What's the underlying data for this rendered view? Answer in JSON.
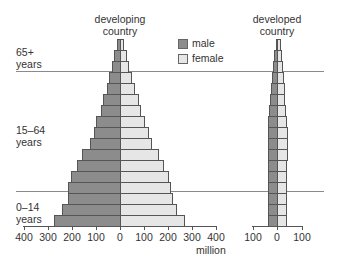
{
  "chart_data": {
    "type": "bar",
    "subtype": "population-pyramid",
    "unit": "million",
    "legend": [
      {
        "name": "male",
        "color": "#8c8c8c"
      },
      {
        "name": "female",
        "color": "#e6e6e6"
      }
    ],
    "age_groups": [
      "0–14 years",
      "15–64 years",
      "65+ years"
    ],
    "charts": [
      {
        "title": "developing country",
        "xlim": [
          -400,
          400
        ],
        "xticks": [
          "400",
          "300",
          "200",
          "100",
          "0",
          "100",
          "200",
          "300",
          "400"
        ],
        "xlabel": "million",
        "bars_bottom_to_top": {
          "male": [
            275,
            240,
            215,
            215,
            205,
            180,
            160,
            125,
            110,
            100,
            80,
            70,
            55,
            45,
            35,
            25,
            12
          ],
          "female": [
            265,
            235,
            215,
            210,
            200,
            180,
            160,
            130,
            115,
            100,
            85,
            75,
            60,
            45,
            35,
            25,
            12
          ]
        }
      },
      {
        "title": "developed country",
        "xlim": [
          -100,
          100
        ],
        "xticks": [
          "100",
          "0",
          "100"
        ],
        "xlabel": "",
        "bars_bottom_to_top": {
          "male": [
            35,
            35,
            35,
            35,
            35,
            35,
            35,
            35,
            35,
            35,
            32,
            28,
            25,
            20,
            15,
            12,
            5
          ],
          "female": [
            35,
            35,
            35,
            35,
            35,
            35,
            40,
            40,
            40,
            35,
            32,
            30,
            28,
            25,
            20,
            15,
            12
          ]
        }
      }
    ]
  },
  "labels": {
    "developing_title_1": "developing",
    "developing_title_2": "country",
    "developed_title_1": "developed",
    "developed_title_2": "country",
    "age_65_1": "65+",
    "age_65_2": "years",
    "age_15_1": "15–64",
    "age_15_2": "years",
    "age_0_1": "0–14",
    "age_0_2": "years",
    "legend_male": "male",
    "legend_female": "female",
    "unit": "million"
  }
}
